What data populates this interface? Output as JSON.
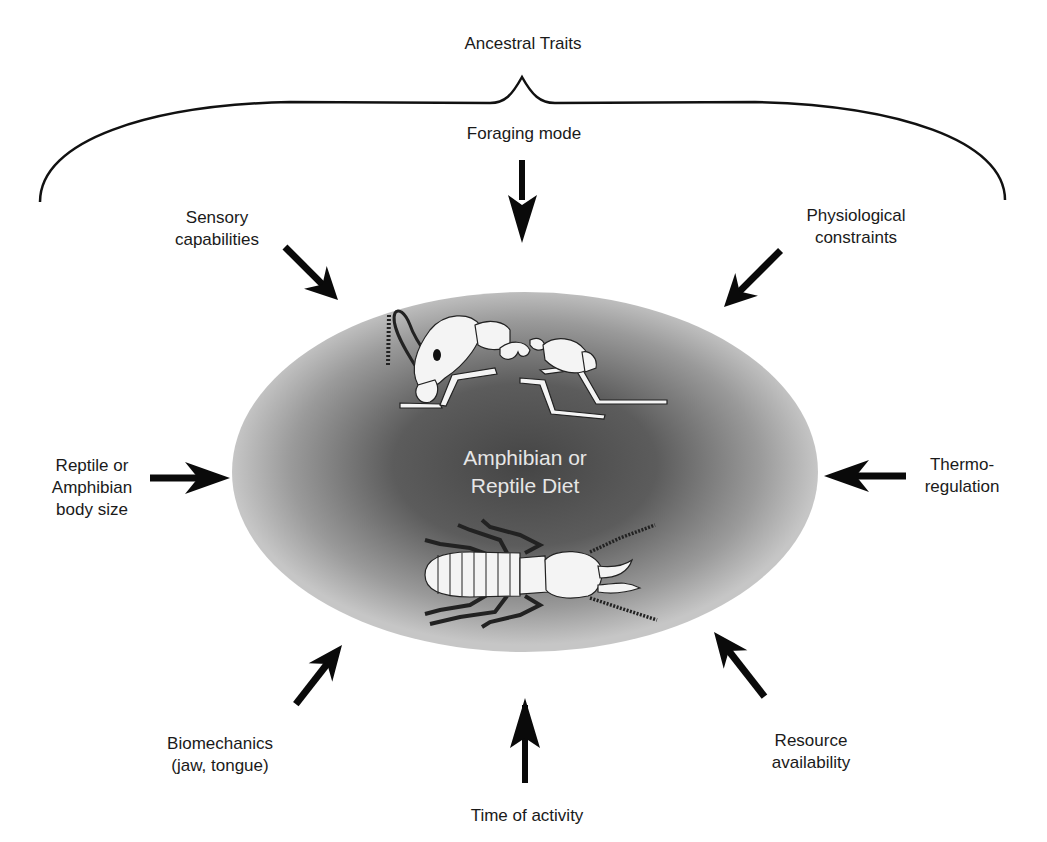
{
  "diagram": {
    "title": "Ancestral Traits",
    "center": {
      "label": "Amphibian or\nReptile Diet",
      "illustrations": [
        "ant",
        "termite"
      ]
    },
    "factors": [
      {
        "id": "foraging-mode",
        "label": "Foraging mode",
        "position": "top"
      },
      {
        "id": "sensory-capabilities",
        "label": "Sensory\ncapabilities",
        "position": "top-left"
      },
      {
        "id": "physiological-constraints",
        "label": "Physiological\nconstraints",
        "position": "top-right"
      },
      {
        "id": "body-size",
        "label": "Reptile or\nAmphibian\nbody size",
        "position": "left"
      },
      {
        "id": "thermoregulation",
        "label": "Thermo-\nregulation",
        "position": "right"
      },
      {
        "id": "biomechanics",
        "label": "Biomechanics\n(jaw, tongue)",
        "position": "bottom-left"
      },
      {
        "id": "time-of-activity",
        "label": "Time of activity",
        "position": "bottom"
      },
      {
        "id": "resource-availability",
        "label": "Resource\navailability",
        "position": "bottom-right"
      }
    ],
    "brace_groups": [
      "foraging-mode",
      "sensory-capabilities",
      "physiological-constraints"
    ],
    "colors": {
      "arrow": "#0a0a0a",
      "ellipse_center": "#4a4a4a",
      "ellipse_edge": "#c4c4c4",
      "insect_fill": "#f4f4f4",
      "text": "#1a1a1a",
      "center_text": "#e6e6e6"
    }
  }
}
